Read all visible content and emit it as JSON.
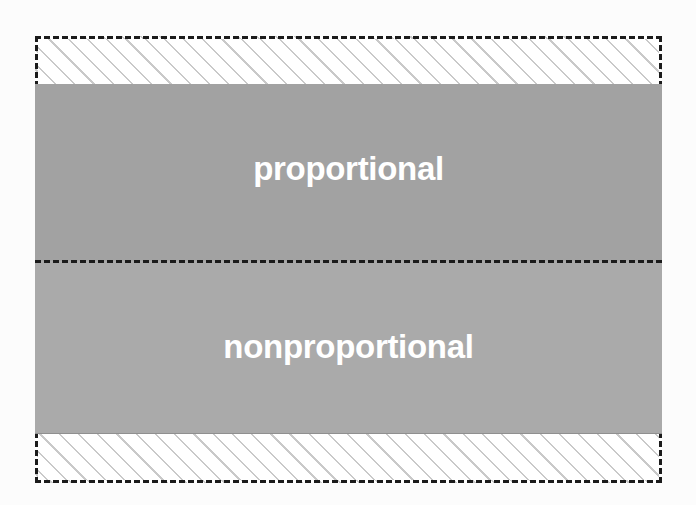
{
  "figure": {
    "title_text": "",
    "background_color": "#fcfcfc",
    "frame": {
      "name": "outer-dashed-frame",
      "border_style": "dashed",
      "border_color": "#1b1b1b",
      "hatch_fill": "diagonal-45-hatch",
      "hatch_line_color": "#c9c9c9",
      "hatch_background_color": "#ffffff"
    },
    "divider": {
      "name": "dashed-divider",
      "style": "dashed",
      "color": "#1b1b1b"
    },
    "regions": [
      {
        "id": "proportional",
        "label": "proportional",
        "fill_color": "#a2a2a2",
        "label_color": "#ffffff"
      },
      {
        "id": "nonproportional",
        "label": "nonproportional",
        "fill_color": "#aaaaaa",
        "label_color": "#ffffff"
      }
    ]
  }
}
